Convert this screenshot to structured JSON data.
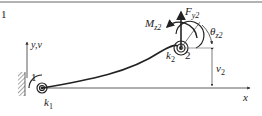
{
  "figure": {
    "corner_label": "1",
    "axis_y_label": "y,v",
    "axis_x_label": "x",
    "node1_label": "1",
    "node2_label": "2",
    "spring1": {
      "base": "k",
      "sub": "1"
    },
    "spring2": {
      "base": "k",
      "sub": "2"
    },
    "force": {
      "base": "F",
      "sub": "y2"
    },
    "moment": {
      "base": "M",
      "sub": "z2"
    },
    "rotation": {
      "base": "θ",
      "sub": "z2"
    },
    "displacement": {
      "base": "v",
      "sub": "2"
    }
  },
  "colors": {
    "line": "#222222",
    "hatch": "#555555",
    "dim": "#444444",
    "frame": "#666666"
  }
}
